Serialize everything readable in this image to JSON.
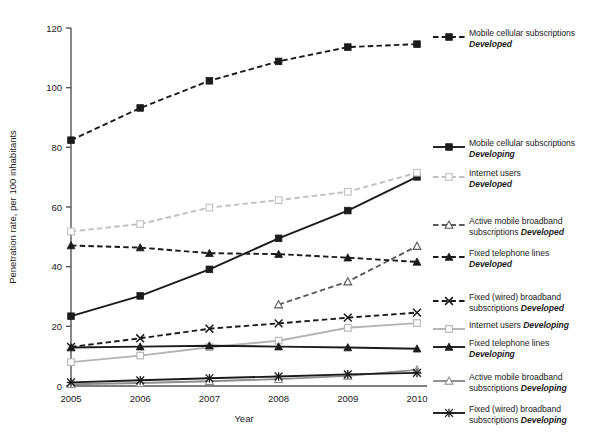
{
  "chart_data": {
    "type": "line",
    "title": "",
    "xlabel": "Year",
    "ylabel": "Penetration rate, per 100 inhabitants",
    "x": [
      2005,
      2006,
      2007,
      2008,
      2009,
      2010
    ],
    "xticklabels": [
      "2005",
      "2006",
      "2007",
      "2008",
      "2009",
      "2010"
    ],
    "yticks": [
      0,
      20,
      40,
      60,
      80,
      100,
      120
    ],
    "yticklabels": [
      "0",
      "20",
      "40",
      "60",
      "80",
      "100",
      "120"
    ],
    "ylim": [
      0,
      120
    ],
    "xlim": [
      2005,
      2010
    ],
    "grid": false,
    "legend_position": "right",
    "series": [
      {
        "name": "Mobile cellular subscriptions Developed",
        "label_main": "Mobile cellular subscriptions",
        "label_em": "Developed",
        "marker": "filled-square",
        "linestyle": "dashed",
        "color": "#1b1b1b",
        "values": [
          82.4,
          93.2,
          102.3,
          108.8,
          113.6,
          114.6
        ]
      },
      {
        "name": "Mobile cellular subscriptions Developing",
        "label_main": "Mobile cellular subscriptions",
        "label_em": "Developing",
        "marker": "filled-square",
        "linestyle": "solid",
        "color": "#1b1b1b",
        "values": [
          23.4,
          30.2,
          39.1,
          49.5,
          58.8,
          70.1
        ]
      },
      {
        "name": "Internet users Developed",
        "label_main": "Internet users",
        "label_em": "Developed",
        "marker": "open-square",
        "linestyle": "dashed",
        "color": "#c0c0c0",
        "values": [
          51.8,
          54.3,
          59.8,
          62.3,
          65.1,
          71.5
        ]
      },
      {
        "name": "Active mobile broadband subscriptions Developed",
        "label_main": "Active mobile broadband subscriptions",
        "label_em": "Developed",
        "marker": "open-triangle",
        "linestyle": "dashed",
        "color": "#5a5a5a",
        "values": [
          null,
          null,
          null,
          27.3,
          35.0,
          46.9
        ]
      },
      {
        "name": "Fixed telephone lines Developed",
        "label_main": "Fixed telephone lines",
        "label_em": "Developed",
        "marker": "filled-triangle",
        "linestyle": "dashed",
        "color": "#1b1b1b",
        "values": [
          47.1,
          46.4,
          44.5,
          44.2,
          43.0,
          41.6
        ]
      },
      {
        "name": "Fixed (wired) broadband subscriptions Developed",
        "label_main": "Fixed (wired) broadband subscriptions",
        "label_em": "Developed",
        "marker": "x-cross",
        "linestyle": "dashed",
        "color": "#1b1b1b",
        "values": [
          13.1,
          16.0,
          19.2,
          21.0,
          22.9,
          24.6
        ]
      },
      {
        "name": "Internet users Developing",
        "label_main": "Internet users",
        "label_em": "Developing",
        "marker": "open-square",
        "linestyle": "solid",
        "color": "#b4b4b4",
        "values": [
          8.0,
          10.2,
          13.0,
          15.2,
          19.5,
          21.1
        ]
      },
      {
        "name": "Fixed telephone lines Developing",
        "label_main": "Fixed telephone lines",
        "label_em": "Developing",
        "marker": "filled-triangle",
        "linestyle": "solid",
        "color": "#1b1b1b",
        "values": [
          12.9,
          13.2,
          13.5,
          13.2,
          12.9,
          12.5
        ]
      },
      {
        "name": "Active mobile broadband subscriptions Developing",
        "label_main": "Active mobile broadband subscriptions",
        "label_em": "Developing",
        "marker": "open-triangle",
        "linestyle": "solid",
        "color": "#8c8c8c",
        "values": [
          0.6,
          1.0,
          1.6,
          2.3,
          3.4,
          5.4
        ]
      },
      {
        "name": "Fixed (wired) broadband subscriptions Developing",
        "label_main": "Fixed (wired) broadband subscriptions",
        "label_em": "Developing",
        "marker": "star-cross",
        "linestyle": "solid",
        "color": "#1b1b1b",
        "values": [
          1.2,
          1.9,
          2.6,
          3.2,
          3.9,
          4.4
        ]
      }
    ]
  },
  "legend": {
    "items": [
      {
        "main": "Mobile cellular subscriptions",
        "em": "Developed",
        "em_inline": false
      },
      {
        "main": "Mobile cellular subscriptions",
        "em": "Developing",
        "em_inline": false
      },
      {
        "main": "Internet users",
        "em": "Developed",
        "em_inline": false
      },
      {
        "main": "Active mobile broadband",
        "main2": "subscriptions",
        "em": "Developed",
        "em_inline": true
      },
      {
        "main": "Fixed telephone lines",
        "em": "Developed",
        "em_inline": false
      },
      {
        "main": "Fixed (wired) broadband",
        "main2": "subscriptions",
        "em": "Developed",
        "em_inline": true
      },
      {
        "main": "Internet users",
        "em": "Developing",
        "em_inline": true
      },
      {
        "main": "Fixed telephone lines",
        "em": "Developing",
        "em_inline": false
      },
      {
        "main": "Active mobile broadband",
        "main2": "subscriptions",
        "em": "Developing",
        "em_inline": true
      },
      {
        "main": "Fixed (wired) broadband",
        "main2": "subscriptions",
        "em": "Developing",
        "em_inline": true
      }
    ]
  }
}
